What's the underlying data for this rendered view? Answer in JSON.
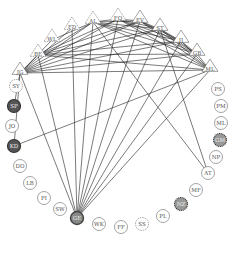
{
  "diagram": {
    "type": "circular-network",
    "colors": {
      "edge": "#222222",
      "node_stroke": "#666666",
      "filled_dark": "#555555",
      "filled_grey": "#888888",
      "dotted_fill": "#999999",
      "label": "#555555"
    },
    "nodes": [
      {
        "id": "JG",
        "label": "JG",
        "shape": "triangle",
        "style": "solid",
        "x": 20,
        "y": 70
      },
      {
        "id": "BE",
        "label": "BE",
        "shape": "triangle",
        "style": "dashed",
        "x": 38,
        "y": 52
      },
      {
        "id": "WL",
        "label": "WL",
        "shape": "triangle",
        "style": "dashed",
        "x": 52,
        "y": 37
      },
      {
        "id": "FD",
        "label": "FD",
        "shape": "triangle",
        "style": "dashed",
        "x": 72,
        "y": 25
      },
      {
        "id": "AL",
        "label": "AL",
        "shape": "triangle",
        "style": "dashed",
        "x": 93,
        "y": 19
      },
      {
        "id": "FO",
        "label": "FO",
        "shape": "triangle",
        "style": "dashed",
        "x": 118,
        "y": 16
      },
      {
        "id": "EV",
        "label": "EV",
        "shape": "triangle",
        "style": "solid",
        "x": 140,
        "y": 18
      },
      {
        "id": "ST",
        "label": "ST",
        "shape": "triangle",
        "style": "solid",
        "x": 160,
        "y": 26
      },
      {
        "id": "JJ",
        "label": "JJ",
        "shape": "triangle",
        "style": "solid",
        "x": 181,
        "y": 38
      },
      {
        "id": "GB",
        "label": "GB",
        "shape": "triangle",
        "style": "solid",
        "x": 197,
        "y": 51
      },
      {
        "id": "MLt",
        "label": "ML",
        "shape": "triangle",
        "style": "solid",
        "x": 210,
        "y": 67
      },
      {
        "id": "PS",
        "label": "PS",
        "shape": "circle",
        "style": "plain",
        "x": 218,
        "y": 89
      },
      {
        "id": "PM",
        "label": "PM",
        "shape": "circle",
        "style": "plain",
        "x": 221,
        "y": 106
      },
      {
        "id": "ML",
        "label": "ML",
        "shape": "circle",
        "style": "plain",
        "x": 221,
        "y": 123
      },
      {
        "id": "GM",
        "label": "GM",
        "shape": "circle",
        "style": "dotted-filled",
        "x": 220,
        "y": 140
      },
      {
        "id": "NP",
        "label": "NP",
        "shape": "circle",
        "style": "plain",
        "x": 216,
        "y": 157
      },
      {
        "id": "AT",
        "label": "AT",
        "shape": "circle",
        "style": "plain",
        "x": 208,
        "y": 173
      },
      {
        "id": "MF",
        "label": "MF",
        "shape": "circle",
        "style": "plain",
        "x": 196,
        "y": 190
      },
      {
        "id": "NZ",
        "label": "NZ",
        "shape": "circle",
        "style": "dotted-filled",
        "x": 181,
        "y": 204
      },
      {
        "id": "PL",
        "label": "PL",
        "shape": "circle",
        "style": "plain",
        "x": 163,
        "y": 216
      },
      {
        "id": "SS",
        "label": "SS",
        "shape": "circle",
        "style": "dashed",
        "x": 142,
        "y": 224
      },
      {
        "id": "FF",
        "label": "FF",
        "shape": "circle",
        "style": "plain",
        "x": 121,
        "y": 227
      },
      {
        "id": "WK",
        "label": "WK",
        "shape": "circle",
        "style": "plain",
        "x": 99,
        "y": 224
      },
      {
        "id": "GE",
        "label": "GE",
        "shape": "circle",
        "style": "filled-grey",
        "x": 77,
        "y": 218
      },
      {
        "id": "SW",
        "label": "SW",
        "shape": "circle",
        "style": "plain",
        "x": 60,
        "y": 209
      },
      {
        "id": "PI",
        "label": "PI",
        "shape": "circle",
        "style": "plain",
        "x": 44,
        "y": 198
      },
      {
        "id": "LB",
        "label": "LB",
        "shape": "circle",
        "style": "plain",
        "x": 30,
        "y": 183
      },
      {
        "id": "DO",
        "label": "DO",
        "shape": "circle",
        "style": "plain",
        "x": 20,
        "y": 166
      },
      {
        "id": "KD",
        "label": "KD",
        "shape": "circle",
        "style": "filled-dark",
        "x": 14,
        "y": 146
      },
      {
        "id": "JO",
        "label": "JO",
        "shape": "circle",
        "style": "plain",
        "x": 12,
        "y": 126
      },
      {
        "id": "SP",
        "label": "SP",
        "shape": "circle",
        "style": "filled-dark",
        "x": 14,
        "y": 106
      },
      {
        "id": "SY",
        "label": "SY",
        "shape": "circle",
        "style": "dashed",
        "x": 16,
        "y": 86
      }
    ],
    "edges": [
      [
        "JG",
        "BE"
      ],
      [
        "JG",
        "WL"
      ],
      [
        "JG",
        "FD"
      ],
      [
        "JG",
        "AL"
      ],
      [
        "JG",
        "FO"
      ],
      [
        "JG",
        "EV"
      ],
      [
        "JG",
        "ST"
      ],
      [
        "JG",
        "JJ"
      ],
      [
        "JG",
        "GB"
      ],
      [
        "JG",
        "MLt"
      ],
      [
        "JG",
        "SP"
      ],
      [
        "JG",
        "KD"
      ],
      [
        "JG",
        "GE"
      ],
      [
        "BE",
        "AL"
      ],
      [
        "BE",
        "FO"
      ],
      [
        "BE",
        "EV"
      ],
      [
        "BE",
        "ST"
      ],
      [
        "BE",
        "JJ"
      ],
      [
        "BE",
        "GB"
      ],
      [
        "BE",
        "MLt"
      ],
      [
        "WL",
        "AL"
      ],
      [
        "AL",
        "FO"
      ],
      [
        "AL",
        "EV"
      ],
      [
        "AL",
        "ST"
      ],
      [
        "AL",
        "JJ"
      ],
      [
        "AL",
        "GB"
      ],
      [
        "AL",
        "MLt"
      ],
      [
        "AL",
        "GE"
      ],
      [
        "AL",
        "AT"
      ],
      [
        "FO",
        "EV"
      ],
      [
        "FO",
        "ST"
      ],
      [
        "FO",
        "JJ"
      ],
      [
        "FO",
        "GB"
      ],
      [
        "FO",
        "MLt"
      ],
      [
        "FO",
        "GE"
      ],
      [
        "EV",
        "ST"
      ],
      [
        "EV",
        "JJ"
      ],
      [
        "EV",
        "GB"
      ],
      [
        "EV",
        "MLt"
      ],
      [
        "EV",
        "GE"
      ],
      [
        "ST",
        "JJ"
      ],
      [
        "ST",
        "GB"
      ],
      [
        "ST",
        "MLt"
      ],
      [
        "ST",
        "GE"
      ],
      [
        "ST",
        "AT"
      ],
      [
        "JJ",
        "GB"
      ],
      [
        "JJ",
        "MLt"
      ],
      [
        "JJ",
        "GE"
      ],
      [
        "GB",
        "MLt"
      ],
      [
        "GB",
        "GE"
      ],
      [
        "MLt",
        "GE"
      ],
      [
        "MLt",
        "KD"
      ],
      [
        "FD",
        "GE"
      ],
      [
        "BE",
        "GE"
      ]
    ]
  }
}
